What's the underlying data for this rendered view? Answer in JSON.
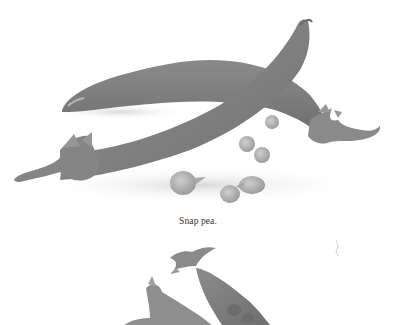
{
  "page": {
    "figures": [
      {
        "id": "figure-snap-pea",
        "description": "Grayscale photograph of two snap pea pods with loose peas",
        "caption": "Snap pea."
      },
      {
        "id": "figure-second",
        "description": "Partially visible grayscale photograph of pea pods with stems (cut off at bottom)"
      }
    ],
    "colors": {
      "background": "#ffffff",
      "pod_dark": "#7a7a7a",
      "pod_mid": "#8e8e8e",
      "pea_light": "#b5b5b5",
      "caption_text": "#333333"
    }
  }
}
